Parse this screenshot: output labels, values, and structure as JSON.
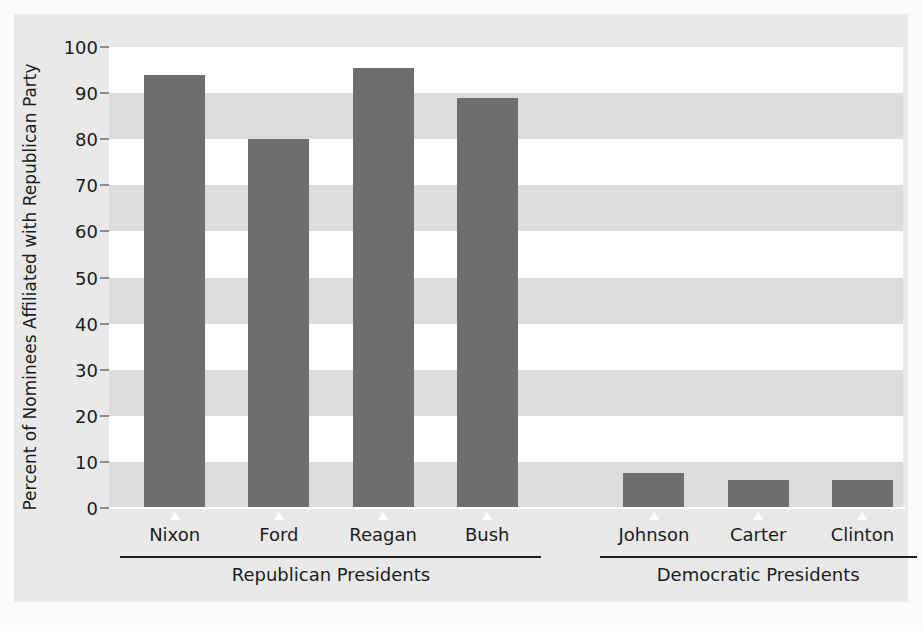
{
  "chart_data": {
    "type": "bar",
    "title": "",
    "xlabel": "",
    "ylabel": "Percent of Nominees Affiliated with Republican Party",
    "ylim": [
      0,
      100
    ],
    "yticks": [
      0,
      10,
      20,
      30,
      40,
      50,
      60,
      70,
      80,
      90,
      100
    ],
    "ytick_labels": [
      "0",
      "10",
      "20",
      "30",
      "40",
      "50",
      "60",
      "70",
      "80",
      "90",
      "100"
    ],
    "categories": [
      "Nixon",
      "Ford",
      "Reagan",
      "Bush",
      "Johnson",
      "Carter",
      "Clinton"
    ],
    "values": [
      94,
      80,
      95.5,
      89,
      7.5,
      6,
      6
    ],
    "grid": "alternating-horizontal-bands",
    "legend": "none",
    "bar_color": "#6e6e6e",
    "band_color": "#dcdcdc",
    "plot_background": "#ffffff",
    "page_background": "#e9e9e9",
    "groups": [
      {
        "label": "Republican Presidents",
        "categories": [
          "Nixon",
          "Ford",
          "Reagan",
          "Bush"
        ]
      },
      {
        "label": "Democratic Presidents",
        "categories": [
          "Johnson",
          "Carter",
          "Clinton"
        ]
      }
    ]
  }
}
